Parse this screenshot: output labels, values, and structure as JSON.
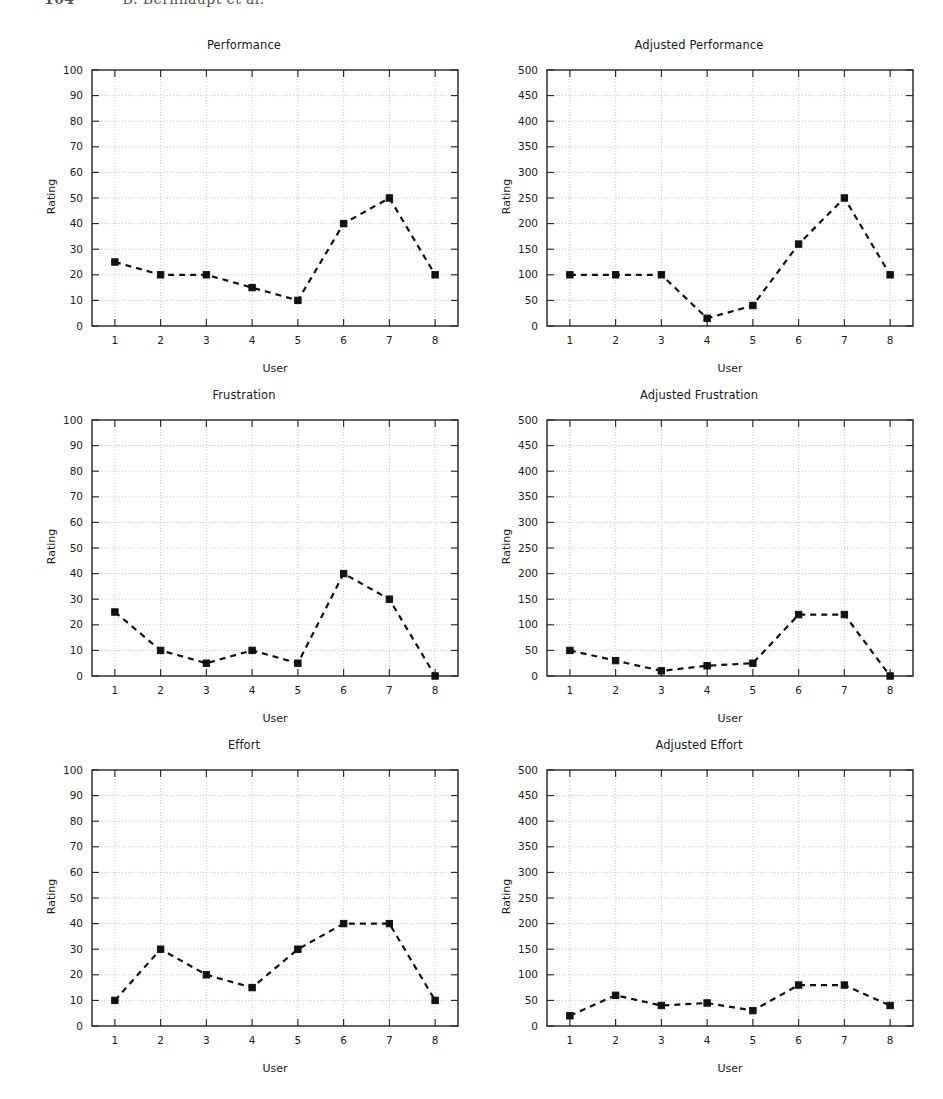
{
  "header": {
    "page_number": "104",
    "authors": "B. Bernhaupt et al.",
    "note": "running header clipped at top edge of page"
  },
  "figure": {
    "axis_titles": {
      "x": "User",
      "y": "Rating"
    },
    "style": {
      "line_color": "#111111",
      "marker_color": "#111111",
      "grid_color": "#b9b9b9",
      "frame_color": "#222222",
      "background": "#ffffff"
    }
  },
  "chart_data": [
    {
      "type": "line",
      "title": "Performance",
      "xlabel": "User",
      "ylabel": "Rating",
      "categories": [
        "1",
        "2",
        "3",
        "4",
        "5",
        "6",
        "7",
        "8"
      ],
      "x": [
        1,
        2,
        3,
        4,
        5,
        6,
        7,
        8
      ],
      "values": [
        25,
        20,
        20,
        15,
        10,
        40,
        50,
        20
      ],
      "ylim": [
        0,
        100
      ],
      "ytick_step": 10,
      "yticks": [
        "0",
        "10",
        "20",
        "30",
        "40",
        "50",
        "60",
        "70",
        "80",
        "90",
        "100"
      ],
      "xlim": [
        0.5,
        8.5
      ],
      "grid": true,
      "legend": "none",
      "series_name": "Performance"
    },
    {
      "type": "line",
      "title": "Adjusted Performance",
      "xlabel": "User",
      "ylabel": "Rating",
      "categories": [
        "1",
        "2",
        "3",
        "4",
        "5",
        "6",
        "7",
        "8"
      ],
      "x": [
        1,
        2,
        3,
        4,
        5,
        6,
        7,
        8
      ],
      "values": [
        100,
        100,
        100,
        15,
        40,
        160,
        250,
        100
      ],
      "ylim": [
        0,
        500
      ],
      "ytick_step": 50,
      "yticks": [
        "0",
        "50",
        "100",
        "150",
        "200",
        "250",
        "300",
        "350",
        "400",
        "450",
        "500"
      ],
      "xlim": [
        0.5,
        8.5
      ],
      "grid": true,
      "legend": "none",
      "series_name": "Adjusted Performance"
    },
    {
      "type": "line",
      "title": "Frustration",
      "xlabel": "User",
      "ylabel": "Rating",
      "categories": [
        "1",
        "2",
        "3",
        "4",
        "5",
        "6",
        "7",
        "8"
      ],
      "x": [
        1,
        2,
        3,
        4,
        5,
        6,
        7,
        8
      ],
      "values": [
        25,
        10,
        5,
        10,
        5,
        40,
        30,
        0
      ],
      "ylim": [
        0,
        100
      ],
      "ytick_step": 10,
      "yticks": [
        "0",
        "10",
        "20",
        "30",
        "40",
        "50",
        "60",
        "70",
        "80",
        "90",
        "100"
      ],
      "xlim": [
        0.5,
        8.5
      ],
      "grid": true,
      "legend": "none",
      "series_name": "Frustration"
    },
    {
      "type": "line",
      "title": "Adjusted Frustration",
      "xlabel": "User",
      "ylabel": "Rating",
      "categories": [
        "1",
        "2",
        "3",
        "4",
        "5",
        "6",
        "7",
        "8"
      ],
      "x": [
        1,
        2,
        3,
        4,
        5,
        6,
        7,
        8
      ],
      "values": [
        50,
        30,
        10,
        20,
        25,
        120,
        120,
        0
      ],
      "ylim": [
        0,
        500
      ],
      "ytick_step": 50,
      "yticks": [
        "0",
        "50",
        "100",
        "150",
        "200",
        "250",
        "300",
        "350",
        "400",
        "450",
        "500"
      ],
      "xlim": [
        0.5,
        8.5
      ],
      "grid": true,
      "legend": "none",
      "series_name": "Adjusted Frustration"
    },
    {
      "type": "line",
      "title": "Effort",
      "xlabel": "User",
      "ylabel": "Rating",
      "categories": [
        "1",
        "2",
        "3",
        "4",
        "5",
        "6",
        "7",
        "8"
      ],
      "x": [
        1,
        2,
        3,
        4,
        5,
        6,
        7,
        8
      ],
      "values": [
        10,
        30,
        20,
        15,
        30,
        40,
        40,
        10
      ],
      "ylim": [
        0,
        100
      ],
      "ytick_step": 10,
      "yticks": [
        "0",
        "10",
        "20",
        "30",
        "40",
        "50",
        "60",
        "70",
        "80",
        "90",
        "100"
      ],
      "xlim": [
        0.5,
        8.5
      ],
      "grid": true,
      "legend": "none",
      "series_name": "Effort"
    },
    {
      "type": "line",
      "title": "Adjusted Effort",
      "xlabel": "User",
      "ylabel": "Rating",
      "categories": [
        "1",
        "2",
        "3",
        "4",
        "5",
        "6",
        "7",
        "8"
      ],
      "x": [
        1,
        2,
        3,
        4,
        5,
        6,
        7,
        8
      ],
      "values": [
        20,
        60,
        40,
        45,
        30,
        80,
        80,
        40
      ],
      "ylim": [
        0,
        500
      ],
      "ytick_step": 50,
      "yticks": [
        "0",
        "50",
        "100",
        "150",
        "200",
        "250",
        "300",
        "350",
        "400",
        "450",
        "500"
      ],
      "xlim": [
        0.5,
        8.5
      ],
      "grid": true,
      "legend": "none",
      "series_name": "Adjusted Effort"
    }
  ]
}
